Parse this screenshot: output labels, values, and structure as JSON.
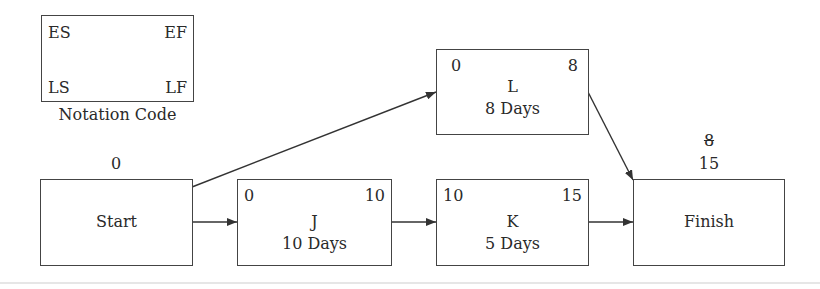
{
  "legend": {
    "es": "ES",
    "ef": "EF",
    "ls": "LS",
    "lf": "LF",
    "caption": "Notation Code"
  },
  "nodes": {
    "start": {
      "label": "Start",
      "above": "0"
    },
    "j": {
      "name": "J",
      "duration": "10 Days",
      "es": "0",
      "ef": "10"
    },
    "k": {
      "name": "K",
      "duration": "5 Days",
      "es": "10",
      "ef": "15"
    },
    "l": {
      "name": "L",
      "duration": "8 Days",
      "es": "0",
      "ef": "8"
    },
    "finish": {
      "label": "Finish",
      "above_struck": "8",
      "above": "15"
    }
  },
  "edges": [
    {
      "from": "Start",
      "to": "J"
    },
    {
      "from": "Start",
      "to": "L"
    },
    {
      "from": "J",
      "to": "K"
    },
    {
      "from": "K",
      "to": "Finish"
    },
    {
      "from": "L",
      "to": "Finish"
    }
  ]
}
